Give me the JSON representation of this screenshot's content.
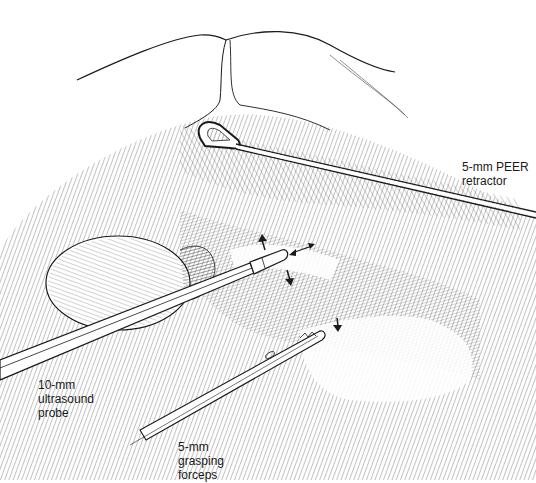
{
  "figure": {
    "type": "surgical line illustration",
    "labels": {
      "retractor": "5-mm PEER\nretractor",
      "probe": "10-mm\nultrasound\nprobe",
      "forceps": "5-mm\ngrasping\nforceps"
    },
    "colors": {
      "ink": "#1a1a1a",
      "background": "#ffffff"
    }
  }
}
